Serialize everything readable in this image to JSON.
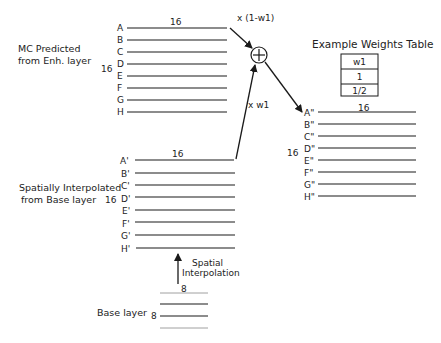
{
  "enh_block": {
    "caption_line1": "MC Predicted",
    "caption_line2": "from Enh. layer",
    "width_label": "16",
    "height_label": "16",
    "rows": [
      "A",
      "B",
      "C",
      "D",
      "E",
      "F",
      "G",
      "H"
    ]
  },
  "interp_block": {
    "caption_line1": "Spatially Interpolated",
    "caption_line2": "from Base layer",
    "width_label": "16",
    "height_label": "16",
    "rows": [
      "A'",
      "B'",
      "C'",
      "D'",
      "E'",
      "F'",
      "G'",
      "H'"
    ]
  },
  "output_block": {
    "width_label": "16",
    "height_label": "16",
    "rows": [
      "A\"",
      "B\"",
      "C\"",
      "D\"",
      "E\"",
      "F\"",
      "G\"",
      "H\""
    ]
  },
  "base_block": {
    "caption": "Base layer",
    "width_label": "8",
    "height_label": "8"
  },
  "operations": {
    "enh_weight_label": "x (1-w1)",
    "interp_weight_label": "x w1",
    "sum_symbol": "+",
    "upsample_line1": "Spatial",
    "upsample_line2": "Interpolation"
  },
  "weights_table": {
    "title": "Example Weights Table",
    "header": "w1",
    "values": [
      "1",
      "1/2"
    ]
  }
}
